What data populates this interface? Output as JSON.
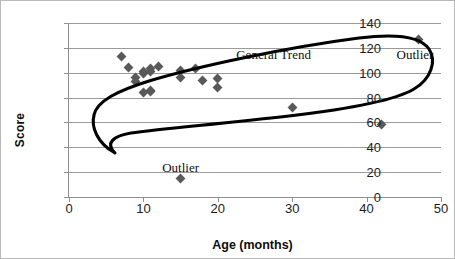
{
  "chart_data": {
    "type": "scatter",
    "title": "",
    "xlabel": "Age (months)",
    "ylabel": "Score",
    "xlim": [
      0,
      50
    ],
    "ylim": [
      0,
      140
    ],
    "xticks": [
      "0",
      "10",
      "20",
      "30",
      "40",
      "50"
    ],
    "yticks": [
      "0",
      "20",
      "40",
      "60",
      "80",
      "100",
      "120",
      "140"
    ],
    "grid": "horizontal",
    "legend": "none",
    "marker": "diamond",
    "marker_color": "#595959",
    "series": [
      {
        "name": "Score vs Age",
        "points": [
          [
            7,
            113
          ],
          [
            8,
            104
          ],
          [
            9,
            96
          ],
          [
            9,
            93
          ],
          [
            10,
            101
          ],
          [
            10,
            99
          ],
          [
            10,
            84
          ],
          [
            11,
            103
          ],
          [
            11,
            101
          ],
          [
            11,
            86
          ],
          [
            11,
            85
          ],
          [
            12,
            105
          ],
          [
            15,
            102
          ],
          [
            15,
            96
          ],
          [
            15,
            15
          ],
          [
            17,
            103
          ],
          [
            18,
            94
          ],
          [
            20,
            95
          ],
          [
            20,
            88
          ],
          [
            30,
            72
          ],
          [
            42,
            58
          ],
          [
            47,
            127
          ]
        ]
      }
    ],
    "annotations": [
      {
        "text": "General Trend",
        "x": 27.5,
        "y": 114
      },
      {
        "text": "Outlier",
        "x": 46.5,
        "y": 114
      },
      {
        "text": "Outlier",
        "x": 15,
        "y": 23
      }
    ]
  },
  "axis": {
    "y_title": "Score",
    "x_title": "Age (months)"
  },
  "annotations": {
    "general_trend": "General Trend",
    "outlier_top": "Outlier",
    "outlier_bottom": "Outlier"
  },
  "colors": {
    "marker": "#595959",
    "gridline": "#9a9a9a",
    "axis": "#8f8f8f",
    "trend_outline": "#000000",
    "border": "#b9b9b9"
  }
}
